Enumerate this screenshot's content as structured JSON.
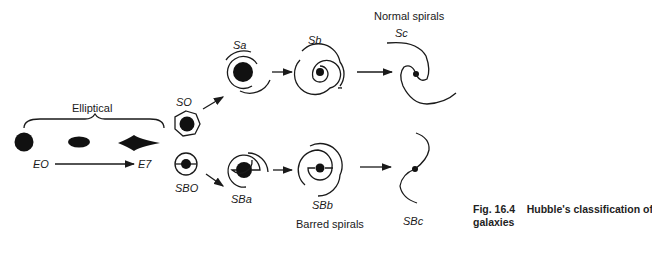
{
  "headings": {
    "elliptical": "Elliptical",
    "normal_spirals": "Normal spirals",
    "barred_spirals": "Barred spirals"
  },
  "elliptical_range": {
    "start": "EO",
    "end": "E7"
  },
  "labels": {
    "s0": "SO",
    "sb0": "SBO",
    "sa": "Sa",
    "sb": "Sb",
    "sc": "Sc",
    "sba": "SBa",
    "sbb": "SBb",
    "sbc": "SBc"
  },
  "caption": {
    "line1": "Fig. 16.4    Hubble's classification of",
    "line2": "galaxies"
  }
}
